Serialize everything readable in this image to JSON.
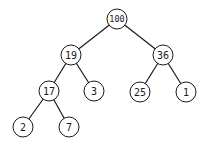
{
  "diagram": {
    "type": "binary-tree",
    "colors": {
      "stroke": "#1a1a1a",
      "fill": "#ffffff",
      "background": "#ffffff"
    },
    "nodes": [
      {
        "id": "n100",
        "label": "100",
        "x": 117,
        "y": 19
      },
      {
        "id": "n19",
        "label": "19",
        "x": 71,
        "y": 55
      },
      {
        "id": "n36",
        "label": "36",
        "x": 163,
        "y": 55
      },
      {
        "id": "n17",
        "label": "17",
        "x": 49,
        "y": 91
      },
      {
        "id": "n3",
        "label": "3",
        "x": 94,
        "y": 91
      },
      {
        "id": "n25",
        "label": "25",
        "x": 140,
        "y": 92
      },
      {
        "id": "n1",
        "label": "1",
        "x": 186,
        "y": 92
      },
      {
        "id": "n2",
        "label": "2",
        "x": 23,
        "y": 127
      },
      {
        "id": "n7",
        "label": "7",
        "x": 69,
        "y": 127
      }
    ],
    "edges": [
      [
        "n100",
        "n19"
      ],
      [
        "n100",
        "n36"
      ],
      [
        "n19",
        "n17"
      ],
      [
        "n19",
        "n3"
      ],
      [
        "n36",
        "n25"
      ],
      [
        "n36",
        "n1"
      ],
      [
        "n17",
        "n2"
      ],
      [
        "n17",
        "n7"
      ]
    ]
  }
}
